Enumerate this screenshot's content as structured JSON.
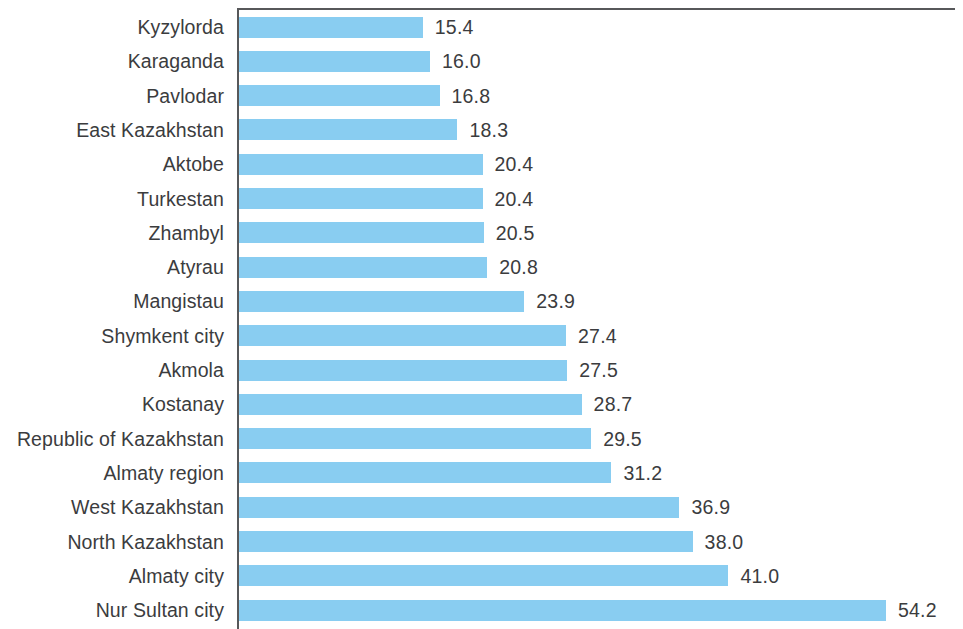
{
  "chart_data": {
    "type": "bar",
    "orientation": "horizontal",
    "title": "",
    "subtitle": "",
    "xlabel": "",
    "ylabel": "",
    "xlim": [
      0,
      54.2
    ],
    "grid": false,
    "legend": null,
    "bar_color": "#89cdf1",
    "axis_color": "#57585a",
    "text_color": "#3b3c3e",
    "categories": [
      "Kyzylorda",
      "Karaganda",
      "Pavlodar",
      "East Kazakhstan",
      "Aktobe",
      "Turkestan",
      "Zhambyl",
      "Atyrau",
      "Mangistau",
      "Shymkent city",
      "Akmola",
      "Kostanay",
      "Republic of Kazakhstan",
      "Almaty region",
      "West Kazakhstan",
      "North Kazakhstan",
      "Almaty city",
      "Nur Sultan city"
    ],
    "values": [
      15.4,
      16.0,
      16.8,
      18.3,
      20.4,
      20.4,
      20.5,
      20.8,
      23.9,
      27.4,
      27.5,
      28.7,
      29.5,
      31.2,
      36.9,
      38.0,
      41.0,
      54.2
    ],
    "value_labels": [
      "15.4",
      "16.0",
      "16.8",
      "18.3",
      "20.4",
      "20.4",
      "20.5",
      "20.8",
      "23.9",
      "27.4",
      "27.5",
      "28.7",
      "29.5",
      "31.2",
      "36.9",
      "38.0",
      "41.0",
      "54.2"
    ]
  }
}
